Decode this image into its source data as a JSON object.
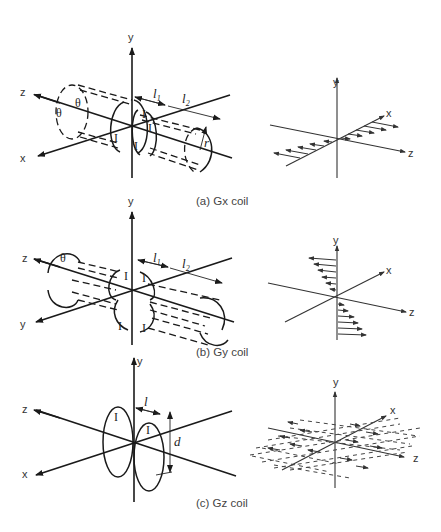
{
  "figure": {
    "panels": [
      {
        "id": "a",
        "caption": "(a) Gx coil",
        "coil_axes": {
          "y": "y",
          "z": "z",
          "x": "x"
        },
        "coil_labels": {
          "angle1": "θ",
          "angle2": "θ",
          "length1": "l",
          "length2": "l",
          "sub1": "1",
          "sub2": "2",
          "radius": "r",
          "current": "I",
          "current2": "I",
          "current3": "I",
          "current4": "I"
        },
        "field_axes": {
          "y": "y",
          "x": "x",
          "z": "z"
        },
        "field_pattern": "linear gradient along x"
      },
      {
        "id": "b",
        "caption": "(b) Gy coil",
        "coil_axes": {
          "y": "y",
          "z": "z",
          "x": "y"
        },
        "coil_labels": {
          "angle1": "θ",
          "length1": "l",
          "length2": "l",
          "sub1": "1",
          "sub2": "2",
          "current": "I",
          "current2": "I",
          "current3": "I",
          "current4": "I"
        },
        "field_axes": {
          "y": "y",
          "x": "x",
          "z": "z"
        },
        "field_pattern": "linear gradient along y"
      },
      {
        "id": "c",
        "caption": "(c) Gz coil",
        "coil_axes": {
          "y": "y",
          "z": "z",
          "x": "x"
        },
        "coil_labels": {
          "length": "l",
          "diameter": "d",
          "current": "I",
          "current2": "I"
        },
        "field_axes": {
          "y": "y",
          "x": "x",
          "z": "z"
        },
        "field_pattern": "linear gradient along z"
      }
    ]
  }
}
